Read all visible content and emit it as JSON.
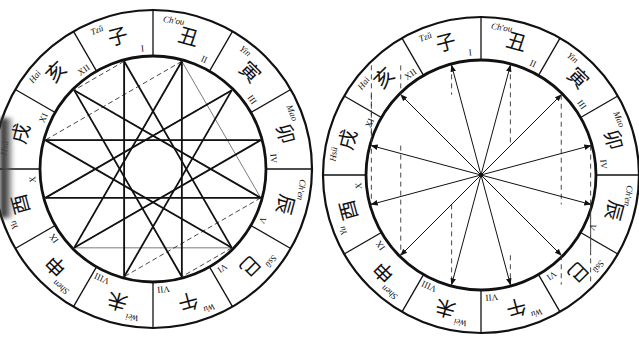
{
  "figure": {
    "branches": [
      {
        "numeral": "I",
        "romanized": "Tzŭ",
        "char": "子"
      },
      {
        "numeral": "II",
        "romanized": "Ch'ou",
        "char": "丑"
      },
      {
        "numeral": "III",
        "romanized": "Yin",
        "char": "寅"
      },
      {
        "numeral": "IV",
        "romanized": "Mao",
        "char": "卯"
      },
      {
        "numeral": "V",
        "romanized": "Ch'en",
        "char": "辰"
      },
      {
        "numeral": "VI",
        "romanized": "Ssŭ",
        "char": "巳"
      },
      {
        "numeral": "VII",
        "romanized": "Wu",
        "char": "午"
      },
      {
        "numeral": "VIII",
        "romanized": "Wei",
        "char": "未"
      },
      {
        "numeral": "IX",
        "romanized": "Shen",
        "char": "申"
      },
      {
        "numeral": "X",
        "romanized": "Yu",
        "char": "酉"
      },
      {
        "numeral": "XI",
        "romanized": "Hsü",
        "char": "戌"
      },
      {
        "numeral": "XII",
        "romanized": "Hai",
        "char": "亥"
      }
    ],
    "left_wheel": {
      "cx": 153,
      "cy": 169,
      "r_outer": 159,
      "r_inner": 113,
      "pattern": "star-polygons",
      "bold_chords": [
        [
          0,
          5
        ],
        [
          5,
          10
        ],
        [
          10,
          3
        ],
        [
          3,
          8
        ],
        [
          8,
          1
        ],
        [
          1,
          6
        ],
        [
          6,
          11
        ],
        [
          11,
          4
        ],
        [
          4,
          9
        ],
        [
          9,
          2
        ],
        [
          2,
          7
        ],
        [
          7,
          0
        ]
      ],
      "thin_chords": [
        [
          0,
          7
        ],
        [
          1,
          4
        ],
        [
          2,
          9
        ],
        [
          3,
          10
        ],
        [
          5,
          8
        ],
        [
          6,
          11
        ]
      ],
      "dashed_chords": [
        [
          0,
          11
        ],
        [
          1,
          10
        ],
        [
          2,
          9
        ],
        [
          3,
          8
        ],
        [
          4,
          7
        ],
        [
          5,
          6
        ],
        [
          1,
          8
        ],
        [
          4,
          11
        ]
      ]
    },
    "right_wheel": {
      "cx": 481,
      "cy": 175,
      "r_outer": 158,
      "r_inner": 115,
      "pattern": "radial-arrows",
      "dashed_verticals": [
        [
          0,
          11
        ],
        [
          1,
          10
        ],
        [
          2,
          9
        ],
        [
          3,
          8
        ],
        [
          4,
          7
        ],
        [
          5,
          6
        ]
      ]
    },
    "colors": {
      "ink": "#111111",
      "paper": "#ffffff",
      "dash": "#333333"
    }
  }
}
